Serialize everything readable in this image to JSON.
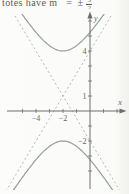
{
  "top_text": {
    "prefix": "totes have m",
    "equals": "=",
    "sign": "±",
    "numerator": "3",
    "denominator": "2"
  },
  "chart_data": {
    "type": "line",
    "equation": "(y − 1)²/9 − (x + 2)²/4 = 1",
    "center": [
      -2,
      1
    ],
    "a": 3,
    "b": 2,
    "vertices": [
      [
        -2,
        4
      ],
      [
        -2,
        -2
      ]
    ],
    "asymptote_slopes": [
      1.5,
      -1.5
    ],
    "asymptote_style": "dashed",
    "grid": false,
    "legend": false,
    "x_axis": {
      "label": "x",
      "range": [
        -6.1,
        2.6
      ],
      "ticks": [
        -5,
        -4,
        -3,
        -2,
        -1,
        1,
        2
      ],
      "tick_labels": {
        "-4": "−4",
        "-2": "−2"
      }
    },
    "y_axis": {
      "label": "y",
      "range": [
        -5.1,
        6.4
      ],
      "ticks": [
        -4,
        -3,
        -2,
        -1,
        1,
        2,
        3,
        4,
        5,
        6
      ],
      "tick_labels": {
        "4": "4",
        "1": "1",
        "-2": "−2"
      }
    },
    "colors": {
      "curve": "#91a099",
      "asymptote": "#a9b1ac",
      "axis": "#6b706d",
      "tick_label": "#606562",
      "text": "#5b5b58",
      "background": "#fbfbf9"
    }
  }
}
